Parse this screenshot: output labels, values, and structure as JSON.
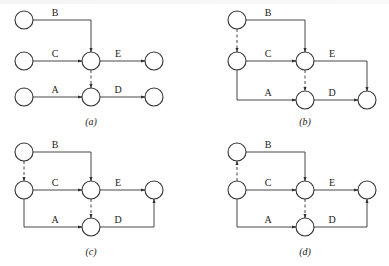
{
  "figure": {
    "colors": {
      "stroke": "#333333",
      "text": "#222222",
      "background": "#ffffff"
    },
    "node_radius": 9,
    "panels": [
      {
        "id": "a",
        "caption": "(a)",
        "caption_pos": [
          91,
          125
        ],
        "nodes": [
          {
            "id": "n1",
            "x": 24,
            "y": 20
          },
          {
            "id": "n2",
            "x": 24,
            "y": 61
          },
          {
            "id": "n3",
            "x": 91,
            "y": 61
          },
          {
            "id": "n4",
            "x": 154,
            "y": 61
          },
          {
            "id": "n5",
            "x": 24,
            "y": 97
          },
          {
            "id": "n6",
            "x": 91,
            "y": 97
          },
          {
            "id": "n7",
            "x": 154,
            "y": 97
          }
        ],
        "edges": [
          {
            "label": "B",
            "type": "solid",
            "path": [
              [
                33,
                20
              ],
              [
                91,
                20
              ],
              [
                91,
                52
              ]
            ],
            "label_pos": [
              55,
              16
            ]
          },
          {
            "label": "C",
            "type": "solid",
            "path": [
              [
                33,
                61
              ],
              [
                82,
                61
              ]
            ],
            "label_pos": [
              55,
              57
            ]
          },
          {
            "label": "E",
            "type": "solid",
            "path": [
              [
                100,
                61
              ],
              [
                145,
                61
              ]
            ],
            "label_pos": [
              118,
              57
            ]
          },
          {
            "label": "",
            "type": "dummy",
            "path": [
              [
                91,
                70
              ],
              [
                91,
                88
              ]
            ],
            "label_pos": null
          },
          {
            "label": "A",
            "type": "solid",
            "path": [
              [
                33,
                97
              ],
              [
                82,
                97
              ]
            ],
            "label_pos": [
              55,
              93
            ]
          },
          {
            "label": "D",
            "type": "solid",
            "path": [
              [
                100,
                97
              ],
              [
                145,
                97
              ]
            ],
            "label_pos": [
              118,
              93
            ]
          }
        ]
      },
      {
        "id": "b",
        "caption": "(b)",
        "caption_pos": [
          305,
          125
        ],
        "nodes": [
          {
            "id": "n1",
            "x": 237,
            "y": 20
          },
          {
            "id": "n2",
            "x": 237,
            "y": 61
          },
          {
            "id": "n3",
            "x": 305,
            "y": 61
          },
          {
            "id": "n4",
            "x": 305,
            "y": 100
          },
          {
            "id": "n5",
            "x": 367,
            "y": 100
          }
        ],
        "edges": [
          {
            "label": "B",
            "type": "solid",
            "path": [
              [
                246,
                20
              ],
              [
                305,
                20
              ],
              [
                305,
                52
              ]
            ],
            "label_pos": [
              268,
              16
            ]
          },
          {
            "label": "",
            "type": "dummy",
            "path": [
              [
                237,
                29
              ],
              [
                237,
                52
              ]
            ],
            "label_pos": null
          },
          {
            "label": "C",
            "type": "solid",
            "path": [
              [
                246,
                61
              ],
              [
                296,
                61
              ]
            ],
            "label_pos": [
              268,
              57
            ]
          },
          {
            "label": "E",
            "type": "solid",
            "path": [
              [
                314,
                61
              ],
              [
                367,
                61
              ],
              [
                367,
                91
              ]
            ],
            "label_pos": [
              332,
              57
            ]
          },
          {
            "label": "",
            "type": "dummy",
            "path": [
              [
                305,
                70
              ],
              [
                305,
                91
              ]
            ],
            "label_pos": null
          },
          {
            "label": "A",
            "type": "solid",
            "path": [
              [
                237,
                70
              ],
              [
                237,
                100
              ],
              [
                296,
                100
              ]
            ],
            "label_pos": [
              268,
              96
            ]
          },
          {
            "label": "D",
            "type": "solid",
            "path": [
              [
                314,
                100
              ],
              [
                358,
                100
              ]
            ],
            "label_pos": [
              332,
              96
            ]
          }
        ]
      },
      {
        "id": "c",
        "caption": "(c)",
        "caption_pos": [
          91,
          255
        ],
        "nodes": [
          {
            "id": "n1",
            "x": 24,
            "y": 152
          },
          {
            "id": "n2",
            "x": 24,
            "y": 190
          },
          {
            "id": "n3",
            "x": 91,
            "y": 190
          },
          {
            "id": "n4",
            "x": 154,
            "y": 190
          },
          {
            "id": "n5",
            "x": 91,
            "y": 227
          }
        ],
        "edges": [
          {
            "label": "B",
            "type": "solid",
            "path": [
              [
                33,
                152
              ],
              [
                91,
                152
              ],
              [
                91,
                181
              ]
            ],
            "label_pos": [
              55,
              148
            ]
          },
          {
            "label": "",
            "type": "dummy",
            "path": [
              [
                24,
                161
              ],
              [
                24,
                181
              ]
            ],
            "label_pos": null
          },
          {
            "label": "C",
            "type": "solid",
            "path": [
              [
                33,
                190
              ],
              [
                82,
                190
              ]
            ],
            "label_pos": [
              55,
              186
            ]
          },
          {
            "label": "E",
            "type": "solid",
            "path": [
              [
                100,
                190
              ],
              [
                145,
                190
              ]
            ],
            "label_pos": [
              118,
              186
            ]
          },
          {
            "label": "",
            "type": "dummy",
            "path": [
              [
                91,
                199
              ],
              [
                91,
                218
              ]
            ],
            "label_pos": null
          },
          {
            "label": "A",
            "type": "solid",
            "path": [
              [
                24,
                199
              ],
              [
                24,
                227
              ],
              [
                82,
                227
              ]
            ],
            "label_pos": [
              55,
              223
            ]
          },
          {
            "label": "D",
            "type": "solid",
            "path": [
              [
                100,
                227
              ],
              [
                154,
                227
              ],
              [
                154,
                199
              ]
            ],
            "label_pos": [
              118,
              223
            ]
          }
        ]
      },
      {
        "id": "d",
        "caption": "(d)",
        "caption_pos": [
          305,
          255
        ],
        "nodes": [
          {
            "id": "n1",
            "x": 237,
            "y": 152
          },
          {
            "id": "n2",
            "x": 237,
            "y": 190
          },
          {
            "id": "n3",
            "x": 305,
            "y": 190
          },
          {
            "id": "n4",
            "x": 367,
            "y": 190
          },
          {
            "id": "n5",
            "x": 305,
            "y": 227
          }
        ],
        "edges": [
          {
            "label": "B",
            "type": "solid",
            "path": [
              [
                246,
                152
              ],
              [
                305,
                152
              ],
              [
                305,
                181
              ]
            ],
            "label_pos": [
              268,
              148
            ]
          },
          {
            "label": "",
            "type": "dummy",
            "path": [
              [
                237,
                181
              ],
              [
                237,
                161
              ]
            ],
            "label_pos": null
          },
          {
            "label": "C",
            "type": "solid",
            "path": [
              [
                246,
                190
              ],
              [
                296,
                190
              ]
            ],
            "label_pos": [
              268,
              186
            ]
          },
          {
            "label": "E",
            "type": "solid",
            "path": [
              [
                314,
                190
              ],
              [
                358,
                190
              ]
            ],
            "label_pos": [
              332,
              186
            ]
          },
          {
            "label": "",
            "type": "dummy",
            "path": [
              [
                305,
                199
              ],
              [
                305,
                218
              ]
            ],
            "label_pos": null
          },
          {
            "label": "A",
            "type": "solid",
            "path": [
              [
                237,
                199
              ],
              [
                237,
                227
              ],
              [
                296,
                227
              ]
            ],
            "label_pos": [
              268,
              223
            ]
          },
          {
            "label": "D",
            "type": "solid",
            "path": [
              [
                314,
                227
              ],
              [
                367,
                227
              ],
              [
                367,
                199
              ]
            ],
            "label_pos": [
              332,
              223
            ]
          }
        ]
      }
    ]
  }
}
